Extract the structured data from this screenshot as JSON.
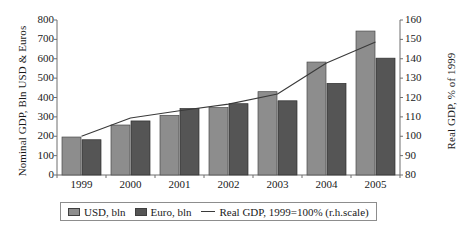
{
  "chart_data": {
    "type": "bar",
    "title": "",
    "subtitle": "",
    "xlabel": "",
    "ylabel": "Nominal GDP, Bln USD & Euros",
    "y2label": "Real GDP, % of 1999",
    "categories": [
      "1999",
      "2000",
      "2001",
      "2002",
      "2003",
      "2004",
      "2005"
    ],
    "ylim": [
      0,
      800
    ],
    "yticks": [
      0,
      100,
      200,
      300,
      400,
      500,
      600,
      700,
      800
    ],
    "y2lim": [
      80,
      160
    ],
    "y2ticks": [
      80,
      90,
      100,
      110,
      120,
      130,
      140,
      150,
      160
    ],
    "grid": false,
    "legend_position": "bottom",
    "series": [
      {
        "name": "USD, bln",
        "type": "bar",
        "axis": "left",
        "color": "#8d8d8d",
        "values": [
          196,
          258,
          308,
          348,
          430,
          583,
          743
        ]
      },
      {
        "name": "Euro, bln",
        "type": "bar",
        "axis": "left",
        "color": "#555555",
        "values": [
          182,
          279,
          343,
          368,
          383,
          473,
          603
        ]
      },
      {
        "name": "Real GDP, 1999=100% (r.h.scale)",
        "type": "line",
        "axis": "right",
        "color": "#3a3a3a",
        "values": [
          100,
          109.4,
          113.2,
          116.6,
          121.8,
          137.8,
          148.6
        ]
      }
    ]
  },
  "legend": {
    "items": [
      {
        "label": "USD, bln",
        "marker": "square-light-gray"
      },
      {
        "label": "Euro, bln",
        "marker": "square-dark-gray"
      },
      {
        "label": "Real GDP, 1999=100% (r.h.scale)",
        "marker": "line"
      }
    ]
  },
  "colors": {
    "usd_bar": "#8d8d8d",
    "euro_bar": "#555555",
    "line": "#3a3a3a",
    "axis": "#6e6e6e",
    "text": "#1a1a1a",
    "background": "#ffffff"
  }
}
